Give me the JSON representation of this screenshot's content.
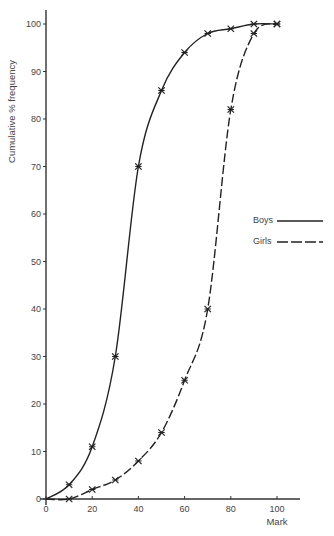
{
  "chart_data": {
    "type": "line",
    "title": "",
    "xlabel": "Mark",
    "ylabel": "Cumulative % frequency",
    "xlim": [
      0,
      100
    ],
    "ylim": [
      0,
      100
    ],
    "xticks": [
      0,
      20,
      40,
      60,
      80,
      100
    ],
    "yticks": [
      0,
      10,
      20,
      30,
      40,
      50,
      60,
      70,
      80,
      90,
      100
    ],
    "grid": false,
    "legend_position": "right-middle",
    "series": [
      {
        "name": "Boys",
        "style": "solid",
        "x": [
          0,
          10,
          20,
          30,
          40,
          50,
          60,
          70,
          80,
          90,
          100
        ],
        "values": [
          0,
          3,
          11,
          30,
          70,
          86,
          94,
          98,
          99,
          100,
          100
        ]
      },
      {
        "name": "Girls",
        "style": "dashed",
        "x": [
          0,
          10,
          20,
          30,
          40,
          50,
          60,
          70,
          80,
          90,
          100
        ],
        "values": [
          0,
          0,
          2,
          4,
          8,
          14,
          25,
          40,
          82,
          98,
          100
        ]
      }
    ]
  },
  "legend": {
    "boys_label": "Boys",
    "girls_label": "Girls"
  }
}
